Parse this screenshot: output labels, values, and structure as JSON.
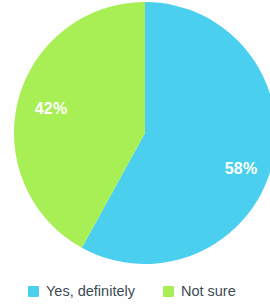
{
  "chart_data": {
    "type": "pie",
    "title": "",
    "subtitle": "",
    "xlabel": "",
    "ylabel": "",
    "grid": false,
    "legend_position": "bottom",
    "start_angle_deg": 0,
    "direction": "clockwise",
    "categories": [
      "Yes, definitely",
      "Not sure"
    ],
    "values": [
      58,
      42
    ],
    "value_unit": "%",
    "data_labels": [
      "58%",
      "42%"
    ],
    "colors": [
      "#4acfee",
      "#a8ee55"
    ],
    "data_label_color": "#ffffff",
    "slices": [
      {
        "label": "Yes, definitely",
        "value": 58,
        "display": "58%",
        "color": "#4acfee"
      },
      {
        "label": "Not sure",
        "value": 42,
        "display": "42%",
        "color": "#a8ee55"
      }
    ]
  },
  "chart": {
    "slice_yes_label": "58%",
    "slice_notsure_label": "42%"
  },
  "legend": {
    "items": [
      {
        "label": "Yes, definitely",
        "color": "#4acfee"
      },
      {
        "label": "Not sure",
        "color": "#a8ee55"
      }
    ]
  },
  "colors": {
    "slice_yes": "#4acfee",
    "slice_not_sure": "#a8ee55",
    "legend_text": "#3c4b54",
    "label_text": "#ffffff",
    "background": "#fefefe"
  }
}
